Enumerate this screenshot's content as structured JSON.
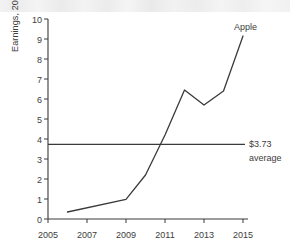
{
  "chart_data": {
    "type": "line",
    "title": "",
    "xlabel": "",
    "ylabel": "Earnings, 2016 dollars",
    "xlim": [
      2005,
      2015
    ],
    "ylim": [
      0,
      10
    ],
    "grid": false,
    "legend": "inline-label",
    "x_ticks": [
      "2005",
      "2007",
      "2009",
      "2011",
      "2013",
      "2015"
    ],
    "x_tick_values": [
      2005,
      2007,
      2009,
      2011,
      2013,
      2015
    ],
    "y_ticks": [
      "0",
      "1",
      "2",
      "3",
      "4",
      "5",
      "6",
      "7",
      "8",
      "9",
      "10"
    ],
    "y_tick_values": [
      0,
      1,
      2,
      3,
      4,
      5,
      6,
      7,
      8,
      9,
      10
    ],
    "series": [
      {
        "name": "Apple",
        "label": "Apple",
        "color": "#3a3a3a",
        "x": [
          2006,
          2009,
          2010,
          2011,
          2012,
          2013,
          2014,
          2015
        ],
        "values": [
          0.35,
          0.98,
          2.2,
          4.2,
          6.45,
          5.7,
          6.4,
          9.15
        ]
      }
    ],
    "reference_line": {
      "value": 3.73,
      "label_line1": "$3.73",
      "label_line2": "average",
      "color": "#3a3a3a"
    }
  },
  "axis": {
    "y_title": "Earnings, 2016 dollars"
  },
  "annotations": {
    "series_label": "Apple",
    "average_value": "$3.73",
    "average_word": "average"
  }
}
